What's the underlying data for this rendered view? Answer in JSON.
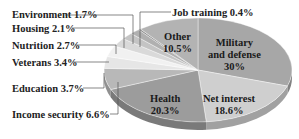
{
  "chart_data": {
    "type": "pie",
    "title": "",
    "style": "3d-tilted",
    "unit": "%",
    "slices": [
      {
        "label": "Military and defense",
        "value": 30,
        "color": "#a7a7a7",
        "label_position": "inside"
      },
      {
        "label": "Net interest",
        "value": 18.6,
        "color": "#cfcfcf",
        "label_position": "inside"
      },
      {
        "label": "Health",
        "value": 20.3,
        "color": "#9c9c9c",
        "label_position": "inside"
      },
      {
        "label": "Income security",
        "value": 6.6,
        "color": "#b8b8b8",
        "label_position": "outside"
      },
      {
        "label": "Education",
        "value": 3.7,
        "color": "#e6e6e6",
        "label_position": "outside"
      },
      {
        "label": "Veterans",
        "value": 3.4,
        "color": "#f1f1f1",
        "label_position": "outside"
      },
      {
        "label": "Nutrition",
        "value": 2.7,
        "color": "#d9d9d9",
        "label_position": "outside"
      },
      {
        "label": "Housing",
        "value": 2.1,
        "color": "#c4c4c4",
        "label_position": "outside"
      },
      {
        "label": "Environment",
        "value": 1.7,
        "color": "#b0b0b0",
        "label_position": "outside"
      },
      {
        "label": "Job training",
        "value": 0.4,
        "color": "#8c8c8c",
        "label_position": "outside"
      },
      {
        "label": "Other",
        "value": 10.5,
        "color": "#b3b3b3",
        "label_position": "inside"
      }
    ]
  },
  "labels": {
    "environment": "Environment 1.7%",
    "job_training": "Job training 0.4%",
    "housing": "Housing 2.1%",
    "nutrition": "Nutrition 2.7%",
    "veterans": "Veterans 3.4%",
    "education": "Education 3.7%",
    "income_security": "Income security 6.6%",
    "other_name": "Other",
    "other_value": "10.5%",
    "military_name_1": "Military",
    "military_name_2": "and defense",
    "military_value": "30%",
    "net_interest_name": "Net interest",
    "net_interest_value": "18.6%",
    "health_name": "Health",
    "health_value": "20.3%"
  }
}
